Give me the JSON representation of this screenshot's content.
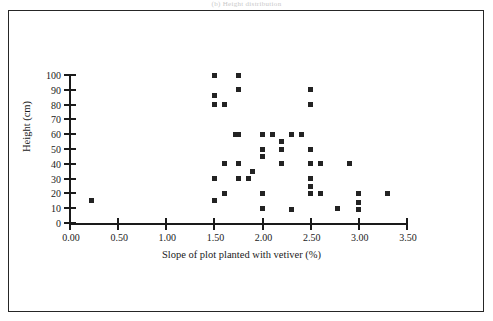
{
  "figure": {
    "top_clipped_caption": "(b)  Height  distribution",
    "background_color": "#ffffff",
    "frame_color": "#262626",
    "marker_color": "#232323"
  },
  "chart_data": {
    "type": "scatter",
    "title": "",
    "xlabel": "Slope of plot planted with vetiver (%)",
    "ylabel": "Height (cm)",
    "xlim": [
      0.0,
      3.5
    ],
    "ylim": [
      0,
      100
    ],
    "xticks": [
      "0.00",
      "0.50",
      "1.00",
      "1.50",
      "2.00",
      "2.50",
      "3.00",
      "3.50"
    ],
    "xtick_values": [
      0.0,
      0.5,
      1.0,
      1.5,
      2.0,
      2.5,
      3.0,
      3.5
    ],
    "yticks": [
      "0",
      "10",
      "20",
      "30",
      "40",
      "50",
      "60",
      "70",
      "80",
      "90",
      "100"
    ],
    "ytick_values": [
      0,
      10,
      20,
      30,
      40,
      50,
      60,
      70,
      80,
      90,
      100
    ],
    "grid": false,
    "legend": false,
    "marker": "square",
    "points": [
      {
        "x": 0.22,
        "y": 15
      },
      {
        "x": 1.5,
        "y": 100
      },
      {
        "x": 1.75,
        "y": 100
      },
      {
        "x": 1.75,
        "y": 90
      },
      {
        "x": 1.5,
        "y": 86
      },
      {
        "x": 1.5,
        "y": 80
      },
      {
        "x": 1.6,
        "y": 80
      },
      {
        "x": 2.5,
        "y": 90
      },
      {
        "x": 2.5,
        "y": 80
      },
      {
        "x": 1.72,
        "y": 60
      },
      {
        "x": 1.75,
        "y": 60
      },
      {
        "x": 2.0,
        "y": 60
      },
      {
        "x": 2.1,
        "y": 60
      },
      {
        "x": 2.3,
        "y": 60
      },
      {
        "x": 2.4,
        "y": 60
      },
      {
        "x": 2.2,
        "y": 55
      },
      {
        "x": 2.0,
        "y": 50
      },
      {
        "x": 2.2,
        "y": 50
      },
      {
        "x": 2.5,
        "y": 50
      },
      {
        "x": 2.0,
        "y": 45
      },
      {
        "x": 1.6,
        "y": 40
      },
      {
        "x": 1.75,
        "y": 40
      },
      {
        "x": 2.2,
        "y": 40
      },
      {
        "x": 2.5,
        "y": 40
      },
      {
        "x": 2.6,
        "y": 40
      },
      {
        "x": 2.9,
        "y": 40
      },
      {
        "x": 1.9,
        "y": 35
      },
      {
        "x": 1.5,
        "y": 30
      },
      {
        "x": 1.75,
        "y": 30
      },
      {
        "x": 1.85,
        "y": 30
      },
      {
        "x": 2.5,
        "y": 30
      },
      {
        "x": 2.5,
        "y": 25
      },
      {
        "x": 1.6,
        "y": 20
      },
      {
        "x": 2.0,
        "y": 20
      },
      {
        "x": 2.5,
        "y": 20
      },
      {
        "x": 2.6,
        "y": 20
      },
      {
        "x": 3.0,
        "y": 20
      },
      {
        "x": 3.3,
        "y": 20
      },
      {
        "x": 1.5,
        "y": 15
      },
      {
        "x": 3.0,
        "y": 14
      },
      {
        "x": 2.0,
        "y": 10
      },
      {
        "x": 2.3,
        "y": 9
      },
      {
        "x": 2.78,
        "y": 10
      },
      {
        "x": 3.0,
        "y": 9
      }
    ]
  }
}
